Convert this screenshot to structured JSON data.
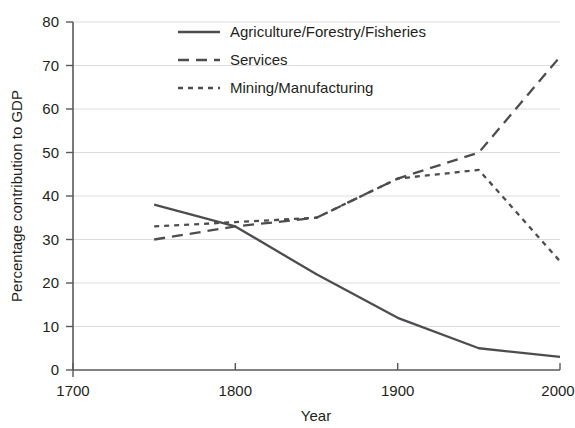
{
  "chart_data": {
    "type": "line",
    "title": "",
    "xlabel": "Year",
    "ylabel": "Percentage contribution to GDP",
    "xlim": [
      1700,
      2000
    ],
    "ylim": [
      0,
      80
    ],
    "xticks": [
      1700,
      1800,
      1900,
      2000
    ],
    "yticks": [
      0,
      10,
      20,
      30,
      40,
      50,
      60,
      70,
      80
    ],
    "xtick_labels": [
      "1700",
      "1800",
      "1900",
      "2000"
    ],
    "ytick_labels": [
      "0",
      "10",
      "20",
      "30",
      "40",
      "50",
      "60",
      "70",
      "80"
    ],
    "grid": "horizontal",
    "legend_position": "top-center",
    "x": [
      1750,
      1800,
      1850,
      1900,
      1950,
      2000
    ],
    "series": [
      {
        "name": "Agriculture/Forestry/Fisheries",
        "style": "solid",
        "color": "#4d4d4f",
        "values": [
          38,
          33,
          22,
          12,
          5,
          3
        ]
      },
      {
        "name": "Services",
        "style": "dashed",
        "color": "#4d4d4f",
        "values": [
          30,
          33,
          35,
          44,
          50,
          72
        ]
      },
      {
        "name": "Mining/Manufacturing",
        "style": "dotted",
        "color": "#4d4d4f",
        "values": [
          33,
          34,
          35,
          44,
          46,
          25
        ]
      }
    ]
  },
  "axes": {
    "y_title": "Percentage contribution to GDP",
    "x_title": "Year",
    "y_labels": [
      "80",
      "70",
      "60",
      "50",
      "40",
      "30",
      "20",
      "10",
      "0"
    ],
    "x_labels": [
      "1700",
      "1800",
      "1900",
      "2000"
    ]
  },
  "legend": {
    "items": [
      {
        "label": "Agriculture/Forestry/Fisheries",
        "style": "solid"
      },
      {
        "label": "Services",
        "style": "dashed"
      },
      {
        "label": "Mining/Manufacturing",
        "style": "dotted"
      }
    ]
  }
}
